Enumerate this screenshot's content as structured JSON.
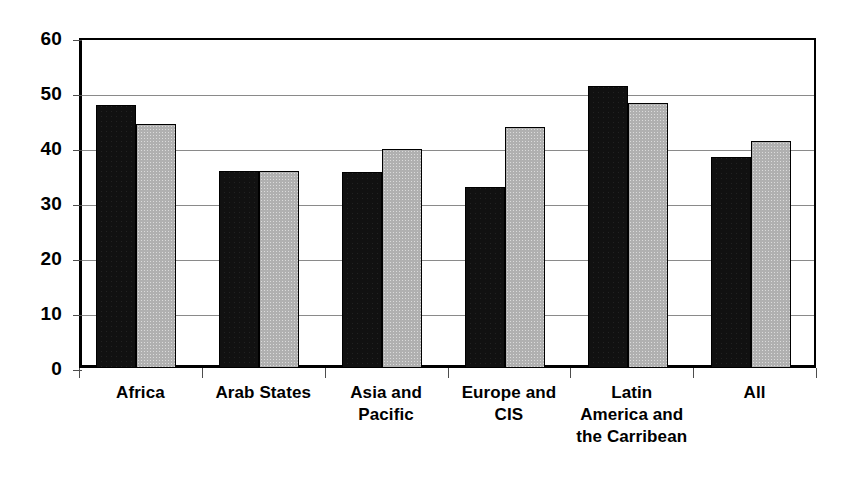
{
  "chart_data": {
    "type": "bar",
    "title": "",
    "subtitle": "",
    "xlabel": "",
    "ylabel": "",
    "ylim": [
      0,
      60
    ],
    "yticks": [
      0,
      10,
      20,
      30,
      40,
      50,
      60
    ],
    "ytick_labels": [
      "0",
      "10",
      "20",
      "30",
      "40",
      "50",
      "60"
    ],
    "grid": true,
    "legend": "none",
    "categories": [
      "Africa",
      "Arab States",
      "Asia and\nPacific",
      "Europe and\nCIS",
      "Latin\nAmerica and\nthe Carribean",
      "All"
    ],
    "series": [
      {
        "name": "series-1",
        "color": "#111111",
        "values": [
          47.9,
          35.9,
          35.6,
          32.9,
          51.3,
          38.4
        ]
      },
      {
        "name": "series-2",
        "color": "#b0b0b0",
        "values": [
          44.3,
          35.9,
          39.8,
          43.8,
          48.2,
          41.2
        ]
      }
    ]
  },
  "axis": {
    "frame_color": "#000000",
    "gridline_color": "#8a8a8a",
    "tick_color": "#4d4d4d"
  }
}
